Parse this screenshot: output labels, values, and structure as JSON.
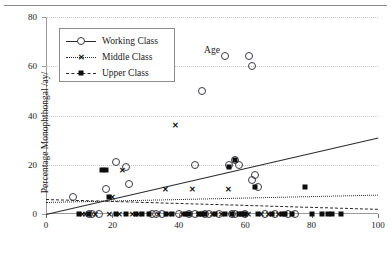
{
  "chart_data": {
    "type": "scatter",
    "title": "",
    "xlabel": "Age",
    "ylabel": "Percentage Monophthongal /ay/",
    "xlim": [
      0,
      100
    ],
    "ylim": [
      0,
      80
    ],
    "xticks": [
      0,
      20,
      40,
      60,
      80,
      100
    ],
    "yticks": [
      0,
      20,
      40,
      60,
      80
    ],
    "grid": true,
    "legend_position": "upper-left-inside",
    "legend": [
      {
        "name": "Working Class",
        "marker": "open-circle",
        "line": "solid"
      },
      {
        "name": "Middle Class",
        "marker": "x",
        "line": "dotted"
      },
      {
        "name": "Upper Class",
        "marker": "filled-square",
        "line": "dashed"
      }
    ],
    "series": [
      {
        "name": "Working Class",
        "marker": "open-circle",
        "trendline": {
          "style": "solid",
          "x0": 0,
          "y0": 0,
          "x1": 100,
          "y1": 31
        },
        "points": [
          [
            8,
            7
          ],
          [
            13,
            0
          ],
          [
            14,
            0
          ],
          [
            16,
            0
          ],
          [
            18,
            10
          ],
          [
            21,
            21
          ],
          [
            24,
            19
          ],
          [
            25,
            12
          ],
          [
            32,
            0
          ],
          [
            33,
            0
          ],
          [
            35,
            0
          ],
          [
            40,
            0
          ],
          [
            43,
            0
          ],
          [
            45,
            20
          ],
          [
            45,
            0
          ],
          [
            47,
            50
          ],
          [
            48,
            0
          ],
          [
            49,
            0
          ],
          [
            52,
            0
          ],
          [
            54,
            64
          ],
          [
            55,
            20
          ],
          [
            56,
            0
          ],
          [
            57,
            22
          ],
          [
            57,
            0
          ],
          [
            58,
            20
          ],
          [
            60,
            0
          ],
          [
            61,
            64
          ],
          [
            62,
            60
          ],
          [
            62,
            14
          ],
          [
            63,
            16
          ],
          [
            64,
            11
          ],
          [
            66,
            0
          ],
          [
            69,
            0
          ],
          [
            73,
            0
          ],
          [
            75,
            0
          ]
        ]
      },
      {
        "name": "Middle Class",
        "marker": "x",
        "trendline": {
          "style": "dotted",
          "x0": 0,
          "y0": 5,
          "x1": 100,
          "y1": 8
        },
        "points": [
          [
            11,
            0
          ],
          [
            12,
            0
          ],
          [
            15,
            0
          ],
          [
            19,
            0
          ],
          [
            20,
            7
          ],
          [
            22,
            0
          ],
          [
            23,
            18
          ],
          [
            26,
            0
          ],
          [
            28,
            0
          ],
          [
            34,
            0
          ],
          [
            36,
            10
          ],
          [
            37,
            0
          ],
          [
            39,
            36
          ],
          [
            41,
            0
          ],
          [
            44,
            10
          ],
          [
            46,
            0
          ],
          [
            50,
            0
          ],
          [
            53,
            0
          ],
          [
            55,
            10
          ],
          [
            59,
            0
          ],
          [
            61,
            0
          ],
          [
            65,
            0
          ],
          [
            67,
            0
          ],
          [
            70,
            0
          ]
        ]
      },
      {
        "name": "Upper Class",
        "marker": "filled-square",
        "trendline": {
          "style": "dashed",
          "x0": 0,
          "y0": 6,
          "x1": 100,
          "y1": 2
        },
        "points": [
          [
            10,
            0
          ],
          [
            13,
            0
          ],
          [
            17,
            18
          ],
          [
            18,
            18
          ],
          [
            19,
            7
          ],
          [
            21,
            0
          ],
          [
            24,
            0
          ],
          [
            27,
            0
          ],
          [
            29,
            0
          ],
          [
            31,
            0
          ],
          [
            36,
            0
          ],
          [
            38,
            0
          ],
          [
            42,
            0
          ],
          [
            43,
            0
          ],
          [
            46,
            0
          ],
          [
            47,
            0
          ],
          [
            48,
            0
          ],
          [
            51,
            0
          ],
          [
            54,
            0
          ],
          [
            55,
            19
          ],
          [
            56,
            0
          ],
          [
            57,
            22
          ],
          [
            58,
            0
          ],
          [
            59,
            0
          ],
          [
            60,
            0
          ],
          [
            63,
            11
          ],
          [
            64,
            0
          ],
          [
            68,
            0
          ],
          [
            71,
            0
          ],
          [
            72,
            0
          ],
          [
            74,
            0
          ],
          [
            78,
            11
          ],
          [
            80,
            0
          ],
          [
            83,
            0
          ],
          [
            85,
            0
          ],
          [
            86,
            0
          ],
          [
            89,
            0
          ]
        ]
      }
    ],
    "annotations": [
      {
        "text": "Working Class",
        "kind": "legend-entry"
      },
      {
        "text": "Middle Class",
        "kind": "legend-entry"
      },
      {
        "text": "Upper Class",
        "kind": "legend-entry"
      }
    ]
  }
}
